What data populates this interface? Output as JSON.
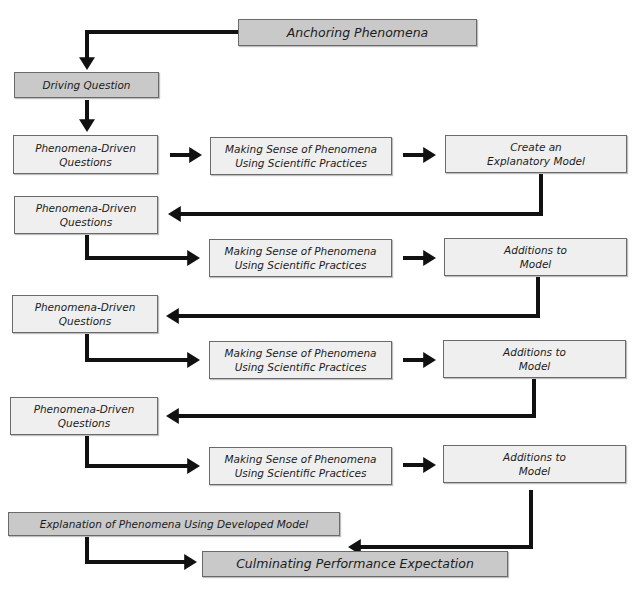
{
  "diagram": {
    "colors": {
      "dark_box": "#c9c9c9",
      "light_box": "#efefef",
      "arrow": "#111111",
      "border": "#6a6a6a"
    },
    "nodes": [
      {
        "id": "anchoring",
        "label": "Anchoring Phenomena",
        "style": "dark"
      },
      {
        "id": "driving",
        "label": "Driving Question",
        "style": "dark"
      },
      {
        "id": "pdq1",
        "label": "Phenomena-Driven\nQuestions",
        "style": "light"
      },
      {
        "id": "ms1",
        "label": "Making Sense of Phenomena\nUsing Scientific Practices",
        "style": "light"
      },
      {
        "id": "model",
        "label": "Create an\nExplanatory Model",
        "style": "light"
      },
      {
        "id": "pdq2",
        "label": "Phenomena-Driven\nQuestions",
        "style": "light"
      },
      {
        "id": "ms2",
        "label": "Making Sense of Phenomena\nUsing Scientific Practices",
        "style": "light"
      },
      {
        "id": "add1",
        "label": "Additions to\nModel",
        "style": "light"
      },
      {
        "id": "pdq3",
        "label": "Phenomena-Driven\nQuestions",
        "style": "light"
      },
      {
        "id": "ms3",
        "label": "Making Sense of Phenomena\nUsing Scientific Practices",
        "style": "light"
      },
      {
        "id": "add2",
        "label": "Additions to\nModel",
        "style": "light"
      },
      {
        "id": "pdq4",
        "label": "Phenomena-Driven\nQuestions",
        "style": "light"
      },
      {
        "id": "ms4",
        "label": "Making Sense of Phenomena\nUsing Scientific Practices",
        "style": "light"
      },
      {
        "id": "add3",
        "label": "Additions to\nModel",
        "style": "light"
      },
      {
        "id": "explanation",
        "label": "Explanation of Phenomena Using Developed Model",
        "style": "dark"
      },
      {
        "id": "culminating",
        "label": "Culminating Performance Expectation",
        "style": "dark"
      }
    ],
    "edges": [
      {
        "from": "anchoring",
        "to": "driving"
      },
      {
        "from": "driving",
        "to": "pdq1"
      },
      {
        "from": "pdq1",
        "to": "ms1"
      },
      {
        "from": "ms1",
        "to": "model"
      },
      {
        "from": "model",
        "to": "pdq2"
      },
      {
        "from": "pdq2",
        "to": "ms2"
      },
      {
        "from": "ms2",
        "to": "add1"
      },
      {
        "from": "add1",
        "to": "pdq3"
      },
      {
        "from": "pdq3",
        "to": "ms3"
      },
      {
        "from": "ms3",
        "to": "add2"
      },
      {
        "from": "add2",
        "to": "pdq4"
      },
      {
        "from": "pdq4",
        "to": "ms4"
      },
      {
        "from": "ms4",
        "to": "add3"
      },
      {
        "from": "add3",
        "to": "explanation"
      },
      {
        "from": "explanation",
        "to": "culminating"
      }
    ]
  }
}
